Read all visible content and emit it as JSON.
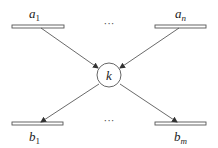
{
  "diagram": {
    "type": "flow-network",
    "center_node": {
      "label": "k",
      "cx": 109,
      "cy": 75,
      "r": 12
    },
    "inputs": [
      {
        "base": "a",
        "sub": "1",
        "bar": {
          "x": 12,
          "y": 25,
          "w": 52,
          "h": 3
        },
        "label_x": 30,
        "label_y": 17,
        "arrow": [
          41,
          28,
          98,
          68
        ]
      },
      {
        "base": "a",
        "sub": "n",
        "bar": {
          "x": 155,
          "y": 25,
          "w": 51,
          "h": 3
        },
        "label_x": 176,
        "label_y": 17,
        "arrow": [
          179,
          28,
          120,
          68
        ]
      }
    ],
    "outputs": [
      {
        "base": "b",
        "sub": "1",
        "bar": {
          "x": 12,
          "y": 122,
          "w": 51,
          "h": 3
        },
        "label_x": 30,
        "label_y": 141,
        "arrow": [
          99,
          84,
          41,
          122
        ]
      },
      {
        "base": "b",
        "sub": "m",
        "bar": {
          "x": 155,
          "y": 122,
          "w": 51,
          "h": 3
        },
        "label_x": 175,
        "label_y": 141,
        "arrow": [
          120,
          84,
          177,
          122
        ]
      }
    ],
    "ellipsis_top": "···",
    "ellipsis_bottom": "···",
    "colors": {
      "stroke": "#333333",
      "bar_fill": "#ffffff",
      "background": "#ffffff"
    }
  }
}
